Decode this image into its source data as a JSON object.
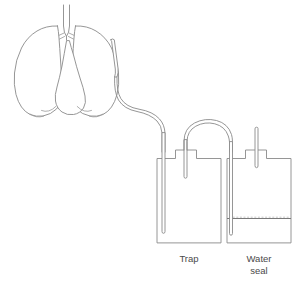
{
  "diagram": {
    "type": "medical-line-diagram",
    "background_color": "#ffffff",
    "line_color": "#8a8a8a",
    "text_color": "#4a4a4a",
    "anatomy": {
      "label": "Lungs, trachea, bronchi and heart outline",
      "parts": [
        "trachea",
        "left-main-bronchus",
        "right-main-bronchus",
        "left-lung",
        "right-lung",
        "heart",
        "diaphragm"
      ]
    },
    "chest_tube": {
      "label": "Chest tube inserted into pleural space",
      "inserted_side": "right-lung"
    },
    "bottles": [
      {
        "id": "trap",
        "label": "Trap",
        "label_lines": [
          "Trap"
        ],
        "has_water_level": false,
        "inlet_tube": "long-dip-tube",
        "outlet_tube": "short-tube"
      },
      {
        "id": "water-seal",
        "label": "Water seal",
        "label_lines": [
          "Water",
          "seal"
        ],
        "has_water_level": true,
        "inlet_tube": "long-dip-tube-below-waterline",
        "outlet_tube": "short-vent-tube"
      }
    ],
    "connectors": [
      {
        "id": "patient-to-trap",
        "label": "Tubing from chest tube to trap bottle"
      },
      {
        "id": "trap-to-water-seal",
        "label": "Arched tubing from trap bottle to water seal bottle"
      }
    ]
  }
}
